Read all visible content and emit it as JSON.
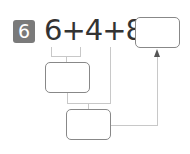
{
  "problem": {
    "number": "6",
    "equation": "6+4+8=",
    "answer_box_value": "",
    "step1_box_value": "",
    "step2_box_value": ""
  }
}
